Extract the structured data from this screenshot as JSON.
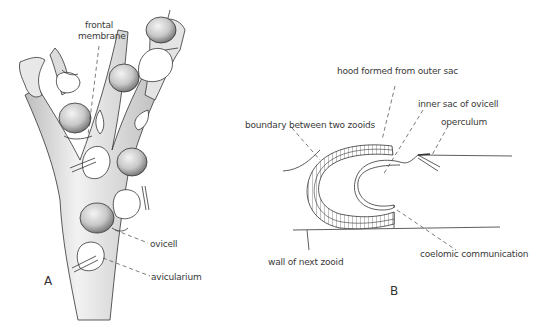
{
  "figure": {
    "panel_a": {
      "letter": "A",
      "labels": {
        "frontal_membrane_line1": "frontal",
        "frontal_membrane_line2": "membrane",
        "ovicell": "ovicell",
        "avicularium": "avicularium"
      }
    },
    "panel_b": {
      "letter": "B",
      "labels": {
        "hood": "hood formed from outer sac",
        "inner_sac": "inner sac of ovicell",
        "boundary": "boundary between two zooids",
        "operculum": "operculum",
        "wall": "wall of next zooid",
        "coelomic": "coelomic communication"
      }
    },
    "colors": {
      "ink": "#333333",
      "shade": "#9a9a9a",
      "background": "#ffffff"
    }
  }
}
